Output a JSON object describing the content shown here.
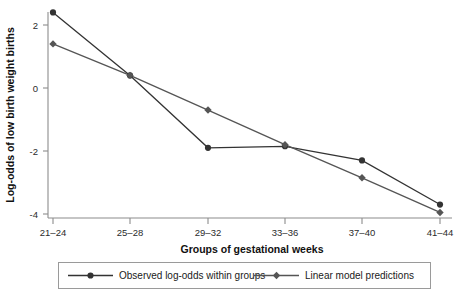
{
  "chart_data": {
    "type": "line",
    "title": "",
    "xlabel": "Groups of gestational weeks",
    "ylabel": "Log-odds of low birth weight births",
    "categories": [
      "21–24",
      "25–28",
      "29–32",
      "33–36",
      "37–40",
      "41–44"
    ],
    "series": [
      {
        "name": "Observed log-odds within groups",
        "marker": "circle",
        "color": "#333333",
        "values": [
          2.4,
          0.4,
          -1.9,
          -1.85,
          -2.3,
          -3.7
        ]
      },
      {
        "name": "Linear model predictions",
        "marker": "diamond",
        "color": "#555555",
        "values": [
          1.4,
          0.4,
          -0.7,
          -1.8,
          -2.85,
          -3.95
        ]
      }
    ],
    "yticks": [
      2,
      0,
      -2,
      -4
    ],
    "ytick_labels": [
      "2",
      "0",
      "-2",
      "-4"
    ],
    "ylim": [
      -4.6,
      2.9
    ],
    "xlim": [
      0,
      5
    ],
    "grid": false,
    "legend_position": "bottom-outside"
  },
  "axes": {
    "y_title": "Log-odds of low birth weight births",
    "x_title": "Groups of gestational weeks",
    "y_tick_labels": [
      "2",
      "0",
      "-2",
      "-4"
    ],
    "x_tick_labels": [
      "21–24",
      "25–28",
      "29–32",
      "33–36",
      "37–40",
      "41–44"
    ]
  },
  "legend": {
    "entries": [
      {
        "label": "Observed log-odds within groups",
        "marker": "circle"
      },
      {
        "label": "Linear model predictions",
        "marker": "diamond"
      }
    ]
  },
  "colors": {
    "axis": "#8c8c8c",
    "series_observed": "#333333",
    "series_predicted": "#555555",
    "legend_border": "#9a9a9a",
    "background": "#ffffff"
  }
}
